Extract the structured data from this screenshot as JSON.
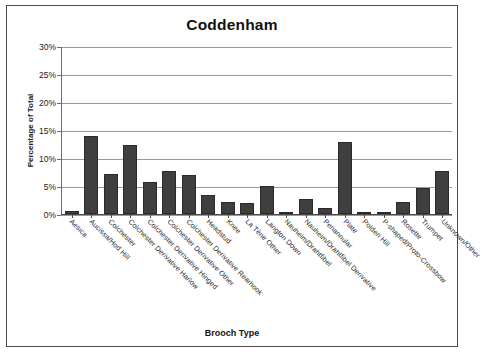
{
  "chart_data": {
    "type": "bar",
    "title": "Coddenham",
    "xlabel": "Brooch Type",
    "ylabel": "Percentage of Total",
    "ylim": [
      0,
      30
    ],
    "ytick_labels": [
      "0%",
      "5%",
      "10%",
      "15%",
      "20%",
      "25%",
      "30%"
    ],
    "ytick_values": [
      0,
      5,
      10,
      15,
      20,
      25,
      30
    ],
    "grid": true,
    "legend": "none",
    "bar_color": "#3f3f3f",
    "categories": [
      "Aesica",
      "Aucissa/Hod Hill",
      "Colchester",
      "Colchester Derivative Harlow",
      "Colchester Derivative Hinged",
      "Colchester Derivative Other",
      "Colchester Derivative Rearhook",
      "Headstud",
      "Knee",
      "La Tène Other",
      "Langton Down",
      "Nauheim/Drahtfibel",
      "Nauheim/Drahtfibel Derivative",
      "Penannular",
      "Plate",
      "Polden Hill",
      "P-shaped/Proto-Crossbow",
      "Rosette",
      "Trumpet",
      "Unknown/Other"
    ],
    "values": [
      0.5,
      14.0,
      7.2,
      12.4,
      5.8,
      7.8,
      7.0,
      3.5,
      2.1,
      1.9,
      5.0,
      0.3,
      2.7,
      1.1,
      13.0,
      0.2,
      0.2,
      2.2,
      4.6,
      7.7
    ]
  }
}
